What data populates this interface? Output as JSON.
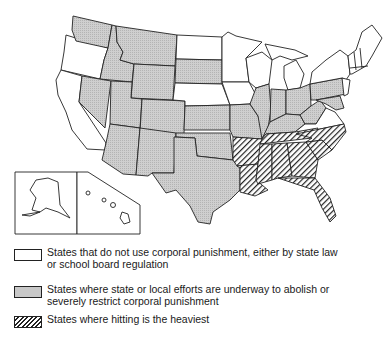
{
  "map": {
    "title": "",
    "colors": {
      "none": "#ffffff",
      "restricting": "#c8c8c8",
      "heaviest": "hatched",
      "border": "#222222"
    },
    "categories": {
      "none": [
        "WA-west-coast",
        "Oregon",
        "California",
        "North Dakota",
        "Nebraska",
        "Minnesota",
        "Iowa",
        "Wisconsin",
        "Michigan",
        "New York",
        "Vermont",
        "New Hampshire",
        "Maine",
        "Massachusetts",
        "Connecticut",
        "Rhode Island",
        "New Jersey",
        "Virginia",
        "Alaska",
        "Hawaii"
      ],
      "restricting": [
        "Washington",
        "Idaho",
        "Montana",
        "Wyoming",
        "Nevada",
        "Utah",
        "Colorado",
        "Arizona",
        "New Mexico",
        "South Dakota",
        "Kansas",
        "Oklahoma",
        "Texas",
        "Missouri",
        "Illinois",
        "Indiana",
        "Ohio",
        "Kentucky",
        "West Virginia",
        "Pennsylvania",
        "Maryland",
        "Delaware"
      ],
      "heaviest": [
        "Arkansas",
        "Louisiana",
        "Tennessee",
        "Mississippi",
        "Alabama",
        "Georgia",
        "South Carolina",
        "North Carolina",
        "Florida"
      ]
    },
    "insets": [
      "Alaska",
      "Hawaii"
    ]
  },
  "legend": {
    "items": [
      {
        "swatch": "white",
        "text": "States that do not use corporal punishment, either by state law or school board regulation"
      },
      {
        "swatch": "gray",
        "text": "States where state or local efforts are underway to abolish or severely restrict corporal punishment"
      },
      {
        "swatch": "hatched",
        "text": "States where hitting is the heaviest"
      }
    ]
  }
}
